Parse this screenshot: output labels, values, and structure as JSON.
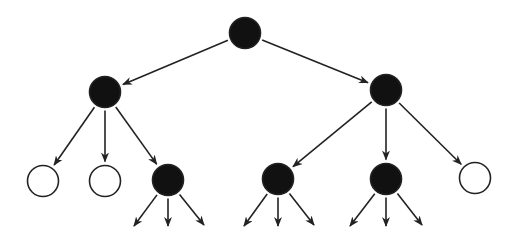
{
  "diagram": {
    "type": "tree",
    "colors": {
      "filled": "#111111",
      "hollow": "#ffffff",
      "stroke": "#222222",
      "background": "#ffffff"
    },
    "nodes": [
      {
        "id": "root",
        "x": 245,
        "y": 33,
        "filled": true
      },
      {
        "id": "a",
        "x": 105,
        "y": 92,
        "filled": true
      },
      {
        "id": "b",
        "x": 386,
        "y": 90,
        "filled": true
      },
      {
        "id": "a1",
        "x": 43,
        "y": 181,
        "filled": false
      },
      {
        "id": "a2",
        "x": 105,
        "y": 181,
        "filled": false
      },
      {
        "id": "a3",
        "x": 168,
        "y": 180,
        "filled": true
      },
      {
        "id": "b1",
        "x": 278,
        "y": 179,
        "filled": true
      },
      {
        "id": "b2",
        "x": 386,
        "y": 179,
        "filled": true
      },
      {
        "id": "b3",
        "x": 475,
        "y": 178,
        "filled": false
      }
    ],
    "edges": [
      {
        "from": "root",
        "to": "a"
      },
      {
        "from": "root",
        "to": "b"
      },
      {
        "from": "a",
        "to": "a1"
      },
      {
        "from": "a",
        "to": "a2"
      },
      {
        "from": "a",
        "to": "a3"
      },
      {
        "from": "b",
        "to": "b1"
      },
      {
        "from": "b",
        "to": "b2"
      },
      {
        "from": "b",
        "to": "b3"
      }
    ],
    "dangling_edges": [
      {
        "from": "a3",
        "to": [
          134,
          226
        ]
      },
      {
        "from": "a3",
        "to": [
          168,
          226
        ]
      },
      {
        "from": "a3",
        "to": [
          204,
          225
        ]
      },
      {
        "from": "b1",
        "to": [
          244,
          226
        ]
      },
      {
        "from": "b1",
        "to": [
          278,
          226
        ]
      },
      {
        "from": "b1",
        "to": [
          314,
          225
        ]
      },
      {
        "from": "b2",
        "to": [
          350,
          226
        ]
      },
      {
        "from": "b2",
        "to": [
          386,
          226
        ]
      },
      {
        "from": "b2",
        "to": [
          422,
          225
        ]
      }
    ]
  }
}
